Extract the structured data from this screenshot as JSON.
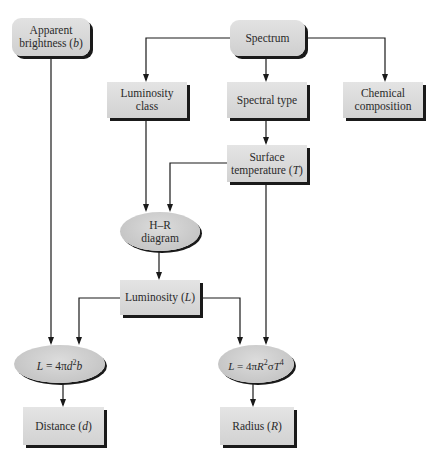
{
  "diagram": {
    "type": "flowchart",
    "nodes": {
      "apparent_brightness": {
        "line1": "Apparent",
        "line2": "brightness (",
        "var": "b",
        "close": ")",
        "shape": "rounded-rect"
      },
      "spectrum": {
        "label": "Spectrum",
        "shape": "rounded-rect"
      },
      "luminosity_class": {
        "line1": "Luminosity",
        "line2": "class",
        "shape": "rect"
      },
      "spectral_type": {
        "label": "Spectral type",
        "shape": "rect"
      },
      "chemical_composition": {
        "line1": "Chemical",
        "line2": "composition",
        "shape": "rect"
      },
      "surface_temperature": {
        "line1": "Surface",
        "line2": "temperature (",
        "var": "T",
        "close": ")",
        "shape": "rect"
      },
      "hr_diagram": {
        "line1": "H–R",
        "line2": "diagram",
        "shape": "ellipse"
      },
      "luminosity": {
        "label": "Luminosity (",
        "var": "L",
        "close": ")",
        "shape": "rect"
      },
      "distance_formula": {
        "lhs": "L",
        "eq": " = 4π",
        "d": "d",
        "sq": "2",
        "b": "b",
        "shape": "ellipse"
      },
      "radius_formula": {
        "lhs": "L",
        "eq": " = 4π",
        "R": "R",
        "sq": "2",
        "sigma": "σ",
        "T": "T",
        "pow": "4",
        "shape": "ellipse"
      },
      "distance": {
        "label": "Distance (",
        "var": "d",
        "close": ")",
        "shape": "rect"
      },
      "radius": {
        "label": "Radius (",
        "var": "R",
        "close": ")",
        "shape": "rect"
      }
    },
    "edges": [
      {
        "from": "Spectrum",
        "to": "Luminosity class"
      },
      {
        "from": "Spectrum",
        "to": "Spectral type"
      },
      {
        "from": "Spectrum",
        "to": "Chemical composition"
      },
      {
        "from": "Spectral type",
        "to": "Surface temperature (T)"
      },
      {
        "from": "Luminosity class",
        "to": "H–R diagram"
      },
      {
        "from": "Surface temperature (T)",
        "to": "H–R diagram"
      },
      {
        "from": "H–R diagram",
        "to": "Luminosity (L)"
      },
      {
        "from": "Apparent brightness (b)",
        "to": "L = 4πd²b"
      },
      {
        "from": "Luminosity (L)",
        "to": "L = 4πd²b"
      },
      {
        "from": "Luminosity (L)",
        "to": "L = 4πR²σT⁴"
      },
      {
        "from": "Surface temperature (T)",
        "to": "L = 4πR²σT⁴"
      },
      {
        "from": "L = 4πd²b",
        "to": "Distance (d)"
      },
      {
        "from": "L = 4πR²σT⁴",
        "to": "Radius (R)"
      }
    ],
    "colors": {
      "node_fill": "#d8d8d8",
      "shadow": "#1a1a1a",
      "line": "#1a1a1a",
      "text": "#2a2a2a"
    }
  }
}
